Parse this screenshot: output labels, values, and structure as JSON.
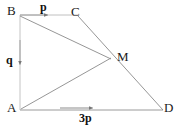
{
  "figure": {
    "type": "vector-geometry-diagram",
    "background_color": "#ffffff",
    "line_color": "#8a8a8a",
    "label_color": "#1a1a1a",
    "width": 184,
    "height": 128,
    "vertices": [
      {
        "name": "B",
        "label": "B",
        "x": 20,
        "y": 15
      },
      {
        "name": "C",
        "label": "C",
        "x": 78,
        "y": 15
      },
      {
        "name": "M",
        "label": "M",
        "x": 110,
        "y": 58
      },
      {
        "name": "A",
        "label": "A",
        "x": 20,
        "y": 110
      },
      {
        "name": "D",
        "label": "D",
        "x": 163,
        "y": 110
      }
    ],
    "vector_labels": [
      {
        "name": "p",
        "text": "p",
        "on_segment": "B-C",
        "direction": "right"
      },
      {
        "name": "q",
        "text": "q",
        "on_segment": "B-A",
        "direction": "down"
      },
      {
        "name": "3p",
        "text": "3p",
        "on_segment": "A-D",
        "direction": "right"
      }
    ],
    "segments": [
      {
        "name": "B-C",
        "from": "B",
        "to": "C",
        "arrow": true
      },
      {
        "name": "B-A",
        "from": "B",
        "to": "A",
        "arrow": true
      },
      {
        "name": "A-D",
        "from": "A",
        "to": "D",
        "arrow": true
      },
      {
        "name": "B-M",
        "from": "B",
        "to": "M",
        "arrow": false
      },
      {
        "name": "C-D",
        "from": "C",
        "to": "D",
        "arrow": false
      },
      {
        "name": "A-M",
        "from": "A",
        "to": "M",
        "arrow": false
      }
    ]
  }
}
